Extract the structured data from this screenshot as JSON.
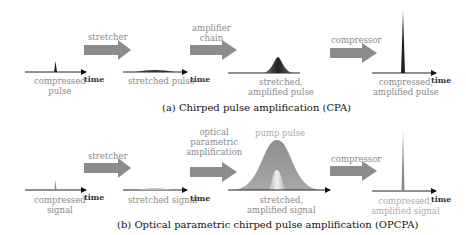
{
  "panel_a": {
    "caption": "(a) Chirped pulse amplification (CPA)",
    "stages": [
      {
        "pulse_label": "compressed\npulse",
        "axis_label": "time"
      },
      {
        "arrow_label": "stretcher",
        "pulse_label": "stretched pulse",
        "axis_label": "time"
      },
      {
        "arrow_label": "amplifier\nchain",
        "pulse_label": "stretched,\namplified pulse"
      },
      {
        "arrow_label": "compressor",
        "pulse_label": "compressed,\namplified pulse",
        "axis_label": "time"
      }
    ]
  },
  "panel_b": {
    "caption": "(b) Optical parametric chirped pulse amplification (OPCPA)",
    "stages": [
      {
        "pulse_label": "compressed\nsignal",
        "axis_label": "time"
      },
      {
        "arrow_label": "stretcher",
        "pulse_label": "stretched signal",
        "axis_label": "time"
      },
      {
        "arrow_label": "optical\nparametric\namplification",
        "pump_label": "pump pulse",
        "pulse_label": "stretched,\namplified signal"
      },
      {
        "arrow_label": "compressor",
        "pulse_label": "compressed,\namplified signal",
        "axis_label": "time"
      }
    ]
  },
  "colors": {
    "arrow": "#8c8c8c",
    "pulse_dark": "#2a2a2a",
    "pump": "#9a9a9a",
    "label": "#8a8a8a"
  }
}
